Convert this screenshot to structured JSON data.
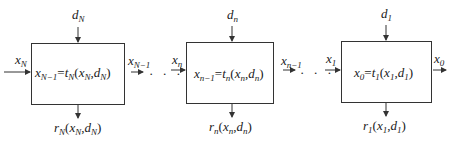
{
  "diagram": {
    "type": "serial multistage decision process",
    "stages": [
      {
        "id": "stage-N",
        "input_state": {
          "base": "x",
          "sub": "N"
        },
        "decision": {
          "base": "d",
          "sub": "N"
        },
        "output_state": {
          "base": "x",
          "sub": "N−1"
        },
        "transform": {
          "lhs_base": "x",
          "lhs_sub": "N−1",
          "eq": "=",
          "fn": "t",
          "fn_sub": "N",
          "args_open": "(",
          "a1": "x",
          "a1_sub": "N",
          "comma": ",",
          "a2": "d",
          "a2_sub": "N",
          "args_close": ")"
        },
        "return": {
          "fn": "r",
          "fn_sub": "N",
          "open": "(",
          "a1": "x",
          "a1_sub": "N",
          "comma": ",",
          "a2": "d",
          "a2_sub": "N",
          "close": ")"
        }
      },
      {
        "id": "stage-n",
        "input_state": {
          "base": "x",
          "sub": "n"
        },
        "decision": {
          "base": "d",
          "sub": "n"
        },
        "output_state": {
          "base": "x",
          "sub": "n−1"
        },
        "transform": {
          "lhs_base": "x",
          "lhs_sub": "n−1",
          "eq": "=",
          "fn": "t",
          "fn_sub": "n",
          "args_open": "(",
          "a1": "x",
          "a1_sub": "n",
          "comma": ",",
          "a2": "d",
          "a2_sub": "n",
          "args_close": ")"
        },
        "return": {
          "fn": "r",
          "fn_sub": "n",
          "open": "(",
          "a1": "x",
          "a1_sub": "n",
          "comma": ",",
          "a2": "d",
          "a2_sub": "n",
          "close": ")"
        }
      },
      {
        "id": "stage-1",
        "input_state": {
          "base": "x",
          "sub": "1"
        },
        "decision": {
          "base": "d",
          "sub": "1"
        },
        "output_state": {
          "base": "x",
          "sub": "0"
        },
        "transform": {
          "lhs_base": "x",
          "lhs_sub": "0",
          "eq": "=",
          "fn": "t",
          "fn_sub": "1",
          "args_open": "(",
          "a1": "x",
          "a1_sub": "1",
          "comma": ",",
          "a2": "d",
          "a2_sub": "1",
          "args_close": ")"
        },
        "return": {
          "fn": "r",
          "fn_sub": "1",
          "open": "(",
          "a1": "x",
          "a1_sub": "1",
          "comma": ",",
          "a2": "d",
          "a2_sub": "1",
          "close": ")"
        }
      }
    ],
    "ellipsis": "· · ·",
    "colors": {
      "line": "#333333",
      "text": "#1a1a1a",
      "background": "#ffffff"
    }
  }
}
